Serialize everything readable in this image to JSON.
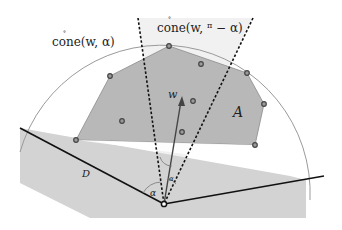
{
  "diagram": {
    "labels": {
      "cone_left": "cone(w, α)",
      "cone_left_parts": {
        "func": "cone",
        "args": "(w, α)"
      },
      "cone_top": "cone(w, π/2 − α)",
      "cone_top_parts": {
        "func": "cone",
        "args_pre": "(w, ",
        "frac_num": "π",
        "frac_den": "2",
        "args_post": " − α)"
      },
      "set_A": "A",
      "set_D": "D",
      "vector_w": "w",
      "angle_alpha": "α",
      "angle_alpha_small": "α"
    },
    "colors": {
      "background": "#ffffff",
      "polygon_fill": "#b9b9b9",
      "band_fill": "#d2d2d2",
      "cone_fill": "#f1f1f1",
      "arc_stroke": "#9a9a9a",
      "line_stroke": "#111111",
      "point_stroke": "#444444"
    },
    "apex": [
      164,
      204
    ],
    "points": [
      [
        110,
        76
      ],
      [
        169,
        46
      ],
      [
        201,
        64
      ],
      [
        247,
        73
      ],
      [
        264,
        104
      ],
      [
        122,
        121
      ],
      [
        193,
        101
      ],
      [
        76,
        140
      ],
      [
        182,
        132
      ],
      [
        255,
        145
      ]
    ]
  }
}
